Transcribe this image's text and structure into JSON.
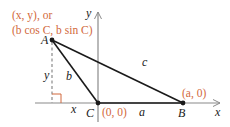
{
  "diagram": {
    "type": "triangle-on-coordinate-plane",
    "colors": {
      "axis": "#8a8a8a",
      "triangle": "#1a1a1a",
      "annotation": "#d2693c",
      "text": "#1a1a1a"
    },
    "axes": {
      "x_label": "x",
      "y_label": "y"
    },
    "vertices": {
      "A": {
        "label": "A",
        "coord_line1": "(x, y), or",
        "coord_line2": "(b cos C, b sin C)"
      },
      "B": {
        "label": "B",
        "coord": "(a, 0)"
      },
      "C": {
        "label": "C",
        "coord": "(0, 0)"
      }
    },
    "sides": {
      "a": "a",
      "b": "b",
      "c": "c"
    },
    "segments": {
      "height_label": "y",
      "base_offset_label": "x"
    }
  }
}
